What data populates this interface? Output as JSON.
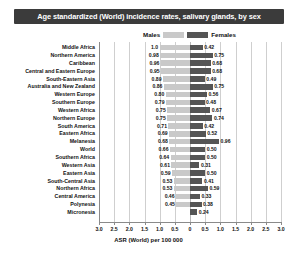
{
  "chart": {
    "title": "Age standardized (World) incidence rates, salivary glands, by sex",
    "xaxis_title": "ASR (World) per 100 000",
    "legend": {
      "male_label": "Males",
      "female_label": "Females"
    },
    "colors": {
      "male_bar": "#c9c9c9",
      "female_bar": "#555555",
      "title_bg": "#3b3b3b",
      "title_text": "#ffffff",
      "gridline": "#cfcfcf",
      "axis": "#8a8a8a"
    }
  },
  "chart_data": {
    "type": "bar",
    "subtype": "diverging-population-pyramid",
    "title": "Age standardized (World) incidence rates, salivary glands, by sex",
    "xlabel": "ASR (World) per 100 000",
    "ylabel": "",
    "xlim": [
      -3.0,
      3.0
    ],
    "xticks": [
      3.0,
      2.5,
      2.0,
      1.5,
      1.0,
      0.5,
      0,
      0.5,
      1.0,
      1.5,
      2.0,
      2.5,
      3.0
    ],
    "xtick_labels": [
      "3.0",
      "2.5",
      "2.0",
      "1.5",
      "1.0",
      "0.5",
      "0",
      "0.5",
      "1.0",
      "1.5",
      "2.0",
      "2.5",
      "3.0"
    ],
    "grid": true,
    "legend_position": "top-center",
    "categories": [
      "Middle Africa",
      "Northern America",
      "Caribbean",
      "Central and Eastern Europe",
      "South-Eastern Asia",
      "Australia and New Zealand",
      "Western Europe",
      "Southern Europe",
      "Western Africa",
      "Northern Europe",
      "South America",
      "Eastern Africa",
      "Melanesia",
      "World",
      "Southern Africa",
      "Western Asia",
      "Eastern Asia",
      "South-Central Asia",
      "Northern Africa",
      "Central America",
      "Polynesia",
      "Micronesia"
    ],
    "series": [
      {
        "name": "Males",
        "direction": "left",
        "color": "#c9c9c9",
        "values": [
          1.0,
          0.98,
          0.96,
          0.95,
          0.89,
          0.86,
          0.8,
          0.79,
          0.75,
          0.75,
          0.71,
          0.69,
          0.68,
          0.66,
          0.64,
          0.61,
          0.59,
          0.53,
          0.53,
          0.46,
          0.45,
          0.0
        ]
      },
      {
        "name": "Females",
        "direction": "right",
        "color": "#555555",
        "values": [
          0.42,
          0.75,
          0.68,
          0.68,
          0.49,
          0.75,
          0.56,
          0.48,
          0.67,
          0.74,
          0.42,
          0.52,
          0.96,
          0.5,
          0.5,
          0.31,
          0.5,
          0.41,
          0.59,
          0.33,
          0.38,
          0.24
        ]
      }
    ],
    "rows": [
      {
        "category": "Middle Africa",
        "male": 1.0,
        "female": 0.42,
        "male_label": "1.0",
        "female_label": "0.42"
      },
      {
        "category": "Northern America",
        "male": 0.98,
        "female": 0.75,
        "male_label": "0.98",
        "female_label": "0.75"
      },
      {
        "category": "Caribbean",
        "male": 0.96,
        "female": 0.68,
        "male_label": "0.96",
        "female_label": "0.68"
      },
      {
        "category": "Central and Eastern Europe",
        "male": 0.95,
        "female": 0.68,
        "male_label": "0.95",
        "female_label": "0.68"
      },
      {
        "category": "South-Eastern Asia",
        "male": 0.89,
        "female": 0.49,
        "male_label": "0.89",
        "female_label": "0.49"
      },
      {
        "category": "Australia and New Zealand",
        "male": 0.86,
        "female": 0.75,
        "male_label": "0.86",
        "female_label": "0.75"
      },
      {
        "category": "Western Europe",
        "male": 0.8,
        "female": 0.56,
        "male_label": "0.80",
        "female_label": "0.56"
      },
      {
        "category": "Southern Europe",
        "male": 0.79,
        "female": 0.48,
        "male_label": "0.79",
        "female_label": "0.48"
      },
      {
        "category": "Western Africa",
        "male": 0.75,
        "female": 0.67,
        "male_label": "0.75",
        "female_label": "0.67"
      },
      {
        "category": "Northern Europe",
        "male": 0.75,
        "female": 0.74,
        "male_label": "0.75",
        "female_label": "0.74"
      },
      {
        "category": "South America",
        "male": 0.71,
        "female": 0.42,
        "male_label": "0.71",
        "female_label": "0.42"
      },
      {
        "category": "Eastern Africa",
        "male": 0.69,
        "female": 0.52,
        "male_label": "0.69",
        "female_label": "0.52"
      },
      {
        "category": "Melanesia",
        "male": 0.68,
        "female": 0.96,
        "male_label": "0.68",
        "female_label": "0.96"
      },
      {
        "category": "World",
        "male": 0.66,
        "female": 0.5,
        "male_label": "0.66",
        "female_label": "0.50"
      },
      {
        "category": "Southern Africa",
        "male": 0.64,
        "female": 0.5,
        "male_label": "0.64",
        "female_label": "0.50"
      },
      {
        "category": "Western Asia",
        "male": 0.61,
        "female": 0.31,
        "male_label": "0.61",
        "female_label": "0.31"
      },
      {
        "category": "Eastern Asia",
        "male": 0.59,
        "female": 0.5,
        "male_label": "0.59",
        "female_label": "0.50"
      },
      {
        "category": "South-Central Asia",
        "male": 0.53,
        "female": 0.41,
        "male_label": "0.53",
        "female_label": "0.41"
      },
      {
        "category": "Northern Africa",
        "male": 0.53,
        "female": 0.59,
        "male_label": "0.53",
        "female_label": "0.59"
      },
      {
        "category": "Central America",
        "male": 0.46,
        "female": 0.33,
        "male_label": "0.46",
        "female_label": "0.33"
      },
      {
        "category": "Polynesia",
        "male": 0.45,
        "female": 0.38,
        "male_label": "0.45",
        "female_label": "0.38"
      },
      {
        "category": "Micronesia",
        "male": 0.0,
        "female": 0.24,
        "male_label": "",
        "female_label": "0.24"
      }
    ]
  }
}
